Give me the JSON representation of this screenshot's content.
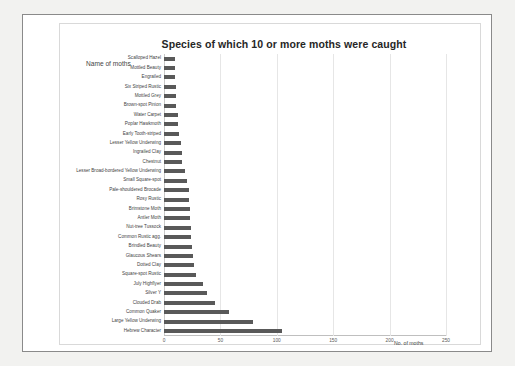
{
  "chart_data": {
    "type": "bar",
    "orientation": "horizontal",
    "title": "Species of which 10 or more moths were caught",
    "xlabel": "No. of moths",
    "ylabel": "Name of moths",
    "xlim": [
      0,
      250
    ],
    "xticks": [
      0,
      50,
      100,
      150,
      200,
      250
    ],
    "xtick_labels": [
      "0",
      "50",
      "100",
      "150",
      "200",
      "250"
    ],
    "grid": true,
    "legend": false,
    "bar_color": "#595959",
    "gridline_color": "#e6e6e6",
    "categories": [
      "Scalloped Hazel",
      "Mottled Beauty",
      "Engrailed",
      "Six Striped Rustic",
      "Mottled Grey",
      "Brown-spot Pinion",
      "Water Carpet",
      "Poplar Hawkmoth",
      "Early Tooth-striped",
      "Lesser Yellow Underwing",
      "Ingrailed Clay",
      "Chestnut",
      "Lesser Broad-bordered Yellow Underwing",
      "Small Square-spot",
      "Pale-shouldered Brocade",
      "Rosy Rustic",
      "Brimstone Moth",
      "Antler Moth",
      "Nut-tree Tussock",
      "Common Rustic agg.",
      "Brindled Beauty",
      "Glaucous Shears",
      "Dotted Clay",
      "Square-spot Rustic",
      "July Highflyer",
      "Silver Y",
      "Clouded Drab",
      "Common Quaker",
      "Large Yellow Underwing",
      "Hebrew Character"
    ],
    "values": [
      10,
      10,
      10,
      11,
      11,
      11,
      12,
      12,
      13,
      15,
      16,
      16,
      19,
      20,
      22,
      22,
      23,
      23,
      24,
      24,
      25,
      26,
      27,
      28,
      35,
      38,
      45,
      58,
      79,
      105
    ],
    "display_order": "ascending_top_to_bottom"
  }
}
